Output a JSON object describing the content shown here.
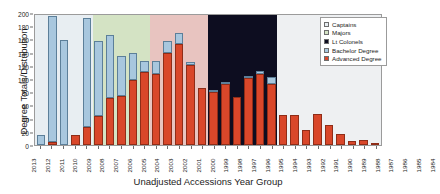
{
  "chart_data": {
    "type": "bar",
    "stacked": true,
    "title": "",
    "xlabel": "Unadjusted Accessions Year Group",
    "ylabel": "Degree Totals/Distribution",
    "ylim": [
      0,
      200
    ],
    "ytick_values": [
      "0",
      "20",
      "40",
      "60",
      "80",
      "100",
      "120",
      "140",
      "160",
      "180",
      "200"
    ],
    "grid": false,
    "legend_position": "top-right",
    "categories": [
      "2013",
      "2012",
      "2011",
      "2010",
      "2009",
      "2008",
      "2007",
      "2006",
      "2005",
      "2004",
      "2003",
      "2002",
      "2001",
      "2000",
      "1999",
      "1998",
      "1997",
      "1996",
      "1995",
      "1994",
      "1993",
      "1992",
      "1991",
      "1990",
      "1989",
      "1988",
      "1987",
      "1986",
      "1985",
      "1984"
    ],
    "series": [
      {
        "name": "Advanced Degree",
        "color": "#d9472a",
        "values": [
          0,
          5,
          0,
          15,
          27,
          44,
          71,
          74,
          98,
          111,
          108,
          140,
          153,
          121,
          87,
          81,
          92,
          73,
          101,
          107,
          92,
          45,
          46,
          23,
          47,
          30,
          16,
          6,
          8,
          1
        ]
      },
      {
        "name": "Bachelor Degree",
        "color": "#a8c7de",
        "values": [
          15,
          190,
          159,
          0,
          165,
          114,
          95,
          61,
          42,
          16,
          20,
          18,
          17,
          5,
          0,
          2,
          4,
          0,
          1,
          5,
          11,
          0,
          0,
          0,
          0,
          0,
          0,
          0,
          0,
          0
        ]
      }
    ],
    "totals": [
      15,
      195,
      159,
      15,
      192,
      158,
      166,
      135,
      140,
      127,
      128,
      158,
      170,
      126,
      87,
      83,
      96,
      73,
      102,
      112,
      103,
      45,
      46,
      23,
      47,
      30,
      16,
      6,
      8,
      1
    ],
    "background_bands": [
      {
        "label": "Captains",
        "color": "#e8eef2",
        "start_year": "2013",
        "end_year": "2009"
      },
      {
        "label": "Majors",
        "color": "#d4e3c4",
        "start_year": "2008",
        "end_year": "2004"
      },
      {
        "label": "Majors-LtCol overlap",
        "color": "#e8c4c0",
        "start_year": "2003",
        "end_year": "1999"
      },
      {
        "label": "Lt Colonels",
        "color": "#0d0d20",
        "start_year": "1998",
        "end_year": "1993"
      },
      {
        "label": "unshaded",
        "color": "#eef0f2",
        "start_year": "1992",
        "end_year": "1984"
      }
    ]
  },
  "legend": {
    "items": [
      {
        "label": "Captains",
        "color": "#e8eef2"
      },
      {
        "label": "Majors",
        "color": "#d4e3c4"
      },
      {
        "label": "Lt Colonels",
        "color": "#0d0d20"
      },
      {
        "label": "Bachelor Degree",
        "color": "#a8c7de"
      },
      {
        "label": "Advanced Degree",
        "color": "#d9472a"
      }
    ]
  }
}
